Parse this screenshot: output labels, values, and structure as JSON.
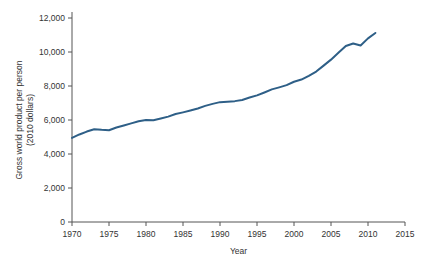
{
  "chart_data": {
    "type": "line",
    "title": "",
    "xlabel": "Year",
    "ylabel": "Gross world product per person (2010 dollars)",
    "ylabel_line1": "Gross world product per person",
    "ylabel_line2": "(2010 dollars)",
    "xlim": [
      1970,
      2015
    ],
    "ylim": [
      0,
      12000
    ],
    "grid": false,
    "legend": null,
    "line_color": "#2e5f87",
    "xticks": [
      1970,
      1975,
      1980,
      1985,
      1990,
      1995,
      2000,
      2005,
      2010,
      2015
    ],
    "xtick_labels": [
      "1970",
      "1975",
      "1980",
      "1985",
      "1990",
      "1995",
      "2000",
      "2005",
      "2010",
      "2015"
    ],
    "yticks": [
      0,
      2000,
      4000,
      6000,
      8000,
      10000,
      12000
    ],
    "ytick_labels": [
      "0",
      "2,000",
      "4,000",
      "6,000",
      "8,000",
      "10,000",
      "12,000"
    ],
    "series": [
      {
        "name": "Gross world product per person",
        "x": [
          1970,
          1971,
          1972,
          1973,
          1974,
          1975,
          1976,
          1977,
          1978,
          1979,
          1980,
          1981,
          1982,
          1983,
          1984,
          1985,
          1986,
          1987,
          1988,
          1989,
          1990,
          1991,
          1992,
          1993,
          1994,
          1995,
          1996,
          1997,
          1998,
          1999,
          2000,
          2001,
          2002,
          2003,
          2004,
          2005,
          2006,
          2007,
          2008,
          2009,
          2010,
          2011
        ],
        "values": [
          4950,
          5150,
          5320,
          5460,
          5420,
          5400,
          5560,
          5680,
          5800,
          5930,
          6000,
          5980,
          6090,
          6200,
          6350,
          6450,
          6560,
          6680,
          6830,
          6950,
          7050,
          7080,
          7110,
          7180,
          7320,
          7450,
          7620,
          7800,
          7920,
          8050,
          8250,
          8380,
          8600,
          8850,
          9200,
          9550,
          9950,
          10350,
          10500,
          10380,
          10800,
          11120
        ]
      }
    ]
  }
}
